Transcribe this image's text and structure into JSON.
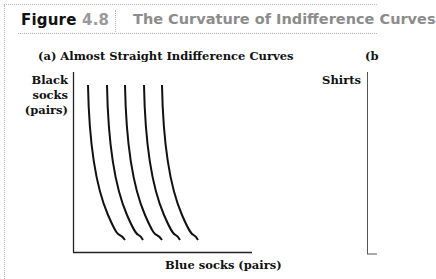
{
  "header": {
    "figure_word": "Figure ",
    "figure_number": "4.8",
    "title": "The Curvature of Indifference Curves"
  },
  "panels": {
    "a": {
      "title": "(a) Almost Straight Indifference Curves",
      "ylabel_lines": [
        "Black",
        "socks",
        "(pairs)"
      ],
      "xlabel": "Blue socks (pairs)"
    },
    "b": {
      "title": "(b",
      "ylabel": "Shirts"
    }
  },
  "colors": {
    "curve": "#111111",
    "axis": "#222222",
    "figure_number": "#9a9a9a",
    "title_gray": "#8c8c8c"
  },
  "chart_data": [
    {
      "type": "line",
      "title": "(a) Almost Straight Indifference Curves",
      "xlabel": "Blue socks (pairs)",
      "ylabel": "Black socks (pairs)",
      "grid": false,
      "legend": "none",
      "ticks": "none",
      "series": [
        {
          "name": "IC1",
          "points_px": [
            [
              88,
              85
            ],
            [
              89,
              140
            ],
            [
              95,
              185
            ],
            [
              108,
              215
            ],
            [
              125,
              240
            ]
          ]
        },
        {
          "name": "IC2",
          "points_px": [
            [
              107,
              85
            ],
            [
              108,
              140
            ],
            [
              114,
              185
            ],
            [
              127,
              215
            ],
            [
              143,
              240
            ]
          ]
        },
        {
          "name": "IC3",
          "points_px": [
            [
              125,
              85
            ],
            [
              126,
              140
            ],
            [
              132,
              185
            ],
            [
              145,
              215
            ],
            [
              162,
              240
            ]
          ]
        },
        {
          "name": "IC4",
          "points_px": [
            [
              144,
              85
            ],
            [
              145,
              140
            ],
            [
              151,
              185
            ],
            [
              164,
              215
            ],
            [
              180,
              240
            ]
          ]
        },
        {
          "name": "IC5",
          "points_px": [
            [
              162,
              85
            ],
            [
              163,
              140
            ],
            [
              169,
              185
            ],
            [
              182,
              215
            ],
            [
              198,
              240
            ]
          ]
        }
      ],
      "note": "Five nearly vertical, slightly convex indifference curves; axes unlabeled numerically"
    },
    {
      "type": "line",
      "title": "(b",
      "ylabel": "Shirts",
      "series": [],
      "note": "Panel cropped at right edge; only y-axis visible"
    }
  ]
}
